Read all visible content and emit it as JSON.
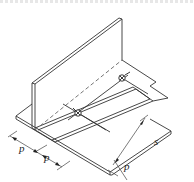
{
  "diagram": {
    "type": "isometric technical drawing",
    "colors": {
      "line": "#333333",
      "dashed": "#666666",
      "background": "#ffffff"
    },
    "labels": {
      "p1": "p",
      "p2": "p",
      "p3": "p",
      "s": "s"
    },
    "markers": [
      {
        "name": "point-1",
        "x": 78,
        "y": 113
      },
      {
        "name": "point-2",
        "x": 122,
        "y": 78
      }
    ]
  }
}
